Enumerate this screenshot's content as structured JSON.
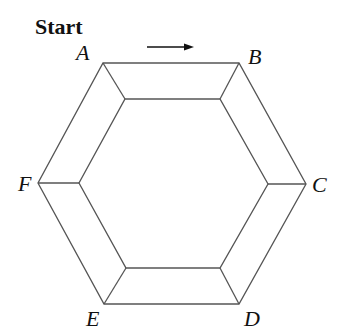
{
  "title": "Start",
  "direction_arrow": "right-arrow",
  "vertices": [
    {
      "label": "A",
      "outer": [
        103,
        63
      ],
      "inner": [
        125,
        99
      ],
      "label_pos": [
        76,
        60
      ]
    },
    {
      "label": "B",
      "outer": [
        239,
        63
      ],
      "inner": [
        220,
        99
      ],
      "label_pos": [
        248,
        64
      ]
    },
    {
      "label": "C",
      "outer": [
        306,
        184
      ],
      "inner": [
        268,
        184
      ],
      "label_pos": [
        312,
        192
      ]
    },
    {
      "label": "D",
      "outer": [
        239,
        304
      ],
      "inner": [
        220,
        268
      ],
      "label_pos": [
        244,
        326
      ]
    },
    {
      "label": "E",
      "outer": [
        104,
        304
      ],
      "inner": [
        126,
        268
      ],
      "label_pos": [
        86,
        326
      ]
    },
    {
      "label": "F",
      "outer": [
        38,
        183
      ],
      "inner": [
        79,
        183
      ],
      "label_pos": [
        18,
        191
      ]
    }
  ],
  "colors": {
    "stroke": "#555555",
    "text": "#111111",
    "background": "#ffffff"
  }
}
